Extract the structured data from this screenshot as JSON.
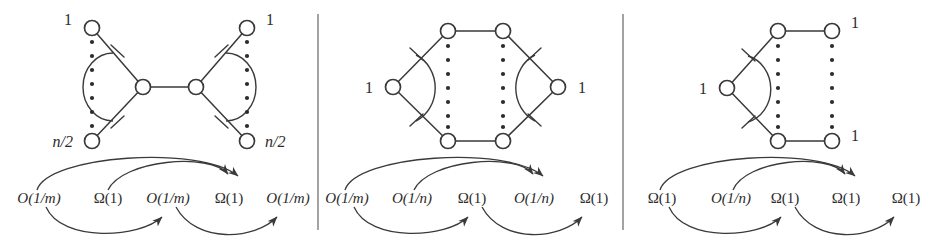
{
  "figure": {
    "width": 940,
    "height": 243,
    "background": "#ffffff",
    "stroke_color": "#3a3a3a",
    "divider_color": "#7c7c7c",
    "text_color": "#2b2b2b"
  },
  "panels": [
    {
      "id": "panel-left",
      "graph": {
        "shape": "bowtie",
        "node_labels": [
          {
            "id": "tl",
            "text": "1",
            "italic": false
          },
          {
            "id": "bl",
            "text": "n/2",
            "italic": true
          },
          {
            "id": "tr",
            "text": "1",
            "italic": false
          },
          {
            "id": "br",
            "text": "n/2",
            "italic": true
          }
        ],
        "vertical_dots_columns": 2,
        "center_nodes": 2
      },
      "annotations": [
        {
          "index": 0,
          "text": "O(1/m)"
        },
        {
          "index": 1,
          "text": "Ω(1)"
        },
        {
          "index": 2,
          "text": "O(1/m)"
        },
        {
          "index": 3,
          "text": "Ω(1)"
        },
        {
          "index": 4,
          "text": "O(1/m)"
        }
      ]
    },
    {
      "id": "panel-middle",
      "graph": {
        "shape": "hexagon",
        "node_labels": [
          {
            "id": "left",
            "text": "1",
            "italic": false
          },
          {
            "id": "right",
            "text": "1",
            "italic": false
          }
        ],
        "vertical_dots_columns": 2,
        "center_nodes": 4
      },
      "annotations": [
        {
          "index": 0,
          "text": "O(1/m)"
        },
        {
          "index": 1,
          "text": "O(1/n)"
        },
        {
          "index": 2,
          "text": "Ω(1)"
        },
        {
          "index": 3,
          "text": "O(1/n)"
        },
        {
          "index": 4,
          "text": "Ω(1)"
        }
      ]
    },
    {
      "id": "panel-right",
      "graph": {
        "shape": "pentagon-open",
        "node_labels": [
          {
            "id": "left",
            "text": "1",
            "italic": false
          },
          {
            "id": "tr",
            "text": "1",
            "italic": false
          },
          {
            "id": "br",
            "text": "1",
            "italic": false
          }
        ],
        "vertical_dots_columns": 2,
        "center_nodes": 4
      },
      "annotations": [
        {
          "index": 0,
          "text": "Ω(1)"
        },
        {
          "index": 1,
          "text": "O(1/n)"
        },
        {
          "index": 2,
          "text": "Ω(1)"
        },
        {
          "index": 3,
          "text": "Ω(1)"
        },
        {
          "index": 4,
          "text": "Ω(1)"
        }
      ]
    }
  ]
}
